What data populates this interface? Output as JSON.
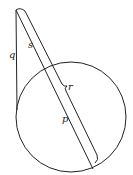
{
  "diagram": {
    "labels": {
      "q": "q",
      "s": "s",
      "r": "r",
      "p": "p"
    },
    "colors": {
      "stroke": "#222222",
      "background": "#ffffff"
    }
  }
}
